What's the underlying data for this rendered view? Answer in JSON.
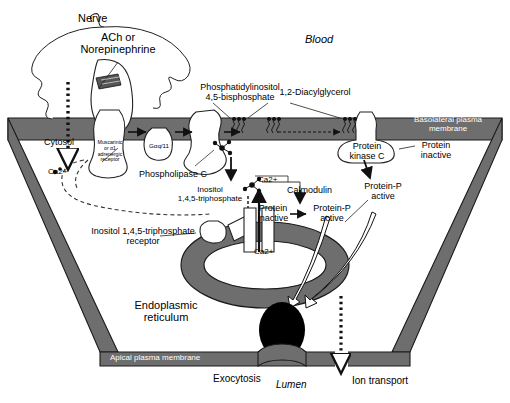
{
  "figure": {
    "title_region": "Epithelial cell phosphoinositide / calcium signaling pathway",
    "background_color": "#ffffff",
    "membrane_color": "#6e6e6e",
    "membrane_stroke": "#1a1a1a",
    "er_color": "#6e6e6e",
    "granule_color": "#000000"
  },
  "labels": {
    "nerve": "Nerve",
    "neurotransmitter": "ACh or\nNorepinephrine",
    "blood": "Blood",
    "pip2": "Phosphatidylinositol\n4,5-bisphosphate",
    "dag": "1,2-Diacylglycerol",
    "basolateral": "Basolateral plasma\nmembrane",
    "receptor": "Muscarinic\nor α1\nadrenergic\nreceptor",
    "g_protein": "Gαq/11",
    "plc": "Phospholipase C",
    "cytosol": "Cytosol",
    "ca_cytosol": "Ca2+",
    "ca_near_ip3": "Ca2+",
    "ca_in_er": "Ca2+",
    "ip3": "Inositol\n1,4,5-triphosphate",
    "ip3_receptor": "Inositol 1,4,5-triphosphate\nreceptor",
    "calmodulin": "Calmodulin",
    "protein_inactive_mid": "Protein\ninactive",
    "protein_p_active_mid": "Protein-P\nactive",
    "pkc": "Protein\nkinase C",
    "protein_inactive_right": "Protein\ninactive",
    "protein_p_active_right": "Protein-P\nactive",
    "er": "Endoplasmic\nreticulum",
    "apical": "Apical plasma membrane",
    "exocytosis": "Exocytosis",
    "lumen": "Lumen",
    "ion_transport": "Ion transport"
  },
  "pathway_steps": [
    "Nerve releases ACh or Norepinephrine",
    "Binds muscarinic or α1 adrenergic receptor",
    "Activates Gαq/11",
    "Activates Phospholipase C",
    "PIP2 cleaved to 1,2-Diacylglycerol and Inositol 1,4,5-triphosphate",
    "IP3 binds IP3 receptor on endoplasmic reticulum",
    "Ca2+ released into cytosol",
    "Ca2+ binds Calmodulin; protein inactive to Protein-P active",
    "DAG activates Protein kinase C; protein inactive to Protein-P active",
    "Downstream: Exocytosis at apical membrane and Ion transport into lumen"
  ]
}
